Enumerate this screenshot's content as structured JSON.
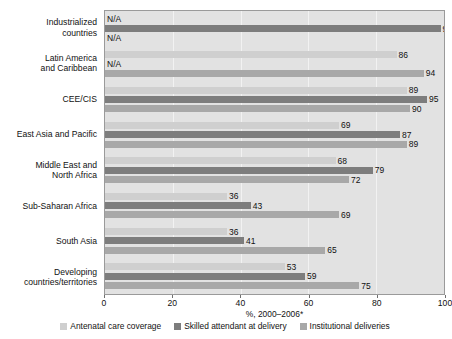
{
  "chart_data": {
    "type": "bar",
    "orientation": "horizontal",
    "title": "",
    "xlabel": "%, 2000–2006*",
    "ylabel": "",
    "xlim": [
      0,
      100
    ],
    "xticks": [
      0,
      20,
      40,
      60,
      80,
      100
    ],
    "grid": true,
    "legend_position": "bottom",
    "na_label": "N/A",
    "categories": [
      "Industrialized countries",
      "Latin America and Caribbean",
      "CEE/CIS",
      "East Asia and Pacific",
      "Middle East and North Africa",
      "Sub-Saharan Africa",
      "South Asia",
      "Developing countries/territories"
    ],
    "category_lines": [
      [
        "Industrialized",
        "countries"
      ],
      [
        "Latin America",
        "and Caribbean"
      ],
      [
        "CEE/CIS"
      ],
      [
        "East Asia and Pacific"
      ],
      [
        "Middle East and",
        "North Africa"
      ],
      [
        "Sub-Saharan Africa"
      ],
      [
        "South Asia"
      ],
      [
        "Developing",
        "countries/territories"
      ]
    ],
    "series": [
      {
        "name": "Antenatal care coverage",
        "color": "#cfcfcf",
        "values": [
          null,
          86,
          89,
          69,
          68,
          36,
          36,
          53
        ]
      },
      {
        "name": "Skilled attendant at delivery",
        "color": "#7d7d7d",
        "values": [
          99,
          null,
          95,
          87,
          79,
          43,
          41,
          59
        ]
      },
      {
        "name": "Institutional deliveries",
        "color": "#a8a8a8",
        "values": [
          null,
          94,
          90,
          89,
          72,
          69,
          65,
          75
        ]
      }
    ]
  }
}
